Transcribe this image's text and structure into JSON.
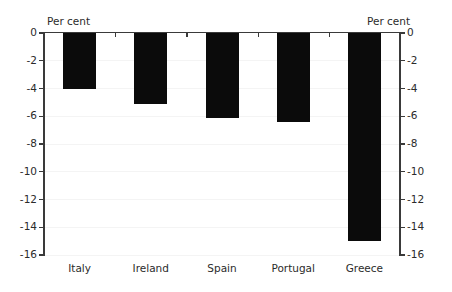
{
  "chart_data": {
    "type": "bar",
    "title": "",
    "subtitle": "",
    "xlabel": "",
    "ylabel": "Per cent",
    "ylabel_right": "Per cent",
    "unit_label_left": "Per cent",
    "unit_label_right": "Per cent",
    "categories": [
      "Italy",
      "Ireland",
      "Spain",
      "Portugal",
      "Greece"
    ],
    "values": [
      -4.0,
      -5.1,
      -6.1,
      -6.4,
      -15.0
    ],
    "series": [
      {
        "name": "Per cent",
        "values": [
          -4.0,
          -5.1,
          -6.1,
          -6.4,
          -15.0
        ],
        "color": "#0b0b0b"
      }
    ],
    "ylim": [
      -16,
      0
    ],
    "ytick_values": [
      0,
      -2,
      -4,
      -6,
      -8,
      -10,
      -12,
      -14,
      -16
    ],
    "ytick_labels": [
      "0",
      "-2",
      "-4",
      "-6",
      "-8",
      "-10",
      "-12",
      "-14",
      "-16"
    ],
    "ytick_labels_right": [
      "0",
      "-2",
      "-4",
      "-6",
      "-8",
      "-10",
      "-12",
      "-14",
      "-16"
    ],
    "grid": true,
    "grid_axis": "y",
    "legend": false,
    "legend_position": "none",
    "orientation": "vertical",
    "bar_color": "#0b0b0b",
    "axis_color": "#3a3a3a",
    "gridline_color": "#f4f4f4",
    "background_color": "#ffffff",
    "dual_axis": true,
    "annotations": []
  }
}
